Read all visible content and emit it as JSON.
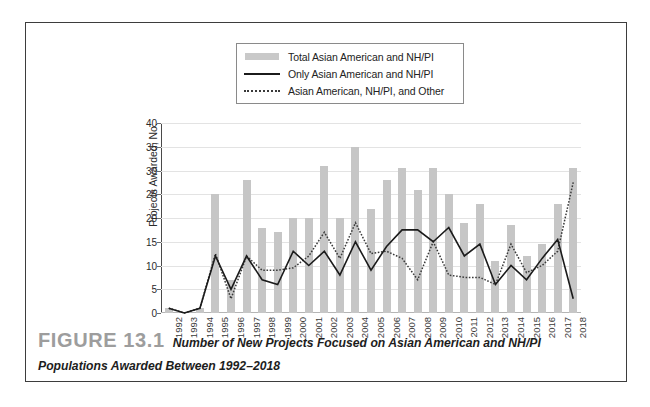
{
  "figure": {
    "number_label": "FIGURE 13.1",
    "caption": "Number of New Projects Focused on Asian American and NH/PI Populations Awarded Between 1992–2018"
  },
  "legend": {
    "items": [
      {
        "key": "bar-swatch",
        "label": "Total Asian American and NH/PI"
      },
      {
        "key": "solid-line-swatch",
        "label": "Only Asian American and NH/PI"
      },
      {
        "key": "dotted-line-swatch",
        "label": "Asian American, NH/PI, and Other"
      }
    ]
  },
  "colors": {
    "bar": "#c6c6c6",
    "solid_line": "#1b1b1b",
    "dotted_line": "#3a3a3a",
    "grid": "#e3e3e3",
    "axis": "#4a4a4a",
    "frame": "#3d3d3d",
    "figure_number": "#9d9d9d"
  },
  "chart_data": {
    "type": "bar",
    "title": "",
    "xlabel": "",
    "ylabel": "Projects Awarded, No.",
    "ylim": [
      0,
      40
    ],
    "yticks": [
      0,
      5,
      10,
      15,
      20,
      25,
      30,
      35,
      40
    ],
    "grid": true,
    "legend_position": "top-center",
    "categories": [
      "1992",
      "1993",
      "1994",
      "1995",
      "1996",
      "1997",
      "1998",
      "1999",
      "2000",
      "2001",
      "2002",
      "2003",
      "2004",
      "2005",
      "2006",
      "2007",
      "2008",
      "2009",
      "2010",
      "2011",
      "2012",
      "2013",
      "2014",
      "2015",
      "2016",
      "2017",
      "2018"
    ],
    "series": [
      {
        "name": "Total Asian American and NH/PI",
        "type": "bar",
        "values": [
          1,
          0,
          1,
          25,
          7,
          28,
          18,
          17,
          20,
          20,
          31,
          20,
          35,
          22,
          28,
          30.5,
          26,
          30.5,
          25,
          19,
          23,
          11,
          18.5,
          12,
          14.5,
          23,
          30.5
        ]
      },
      {
        "name": "Only Asian American and NH/PI",
        "type": "line",
        "values": [
          1,
          0,
          1,
          12,
          5,
          12,
          7,
          6,
          13,
          10,
          13,
          8,
          15,
          9,
          14,
          17.5,
          17.5,
          15,
          18,
          12,
          14.5,
          6,
          10,
          7,
          11.5,
          15.5,
          3
        ]
      },
      {
        "name": "Asian American, NH/PI, and Other",
        "type": "dotted-line",
        "values": [
          1,
          0,
          1,
          12.5,
          3,
          12,
          9,
          9,
          9.5,
          12,
          17,
          11.5,
          19,
          12.5,
          13,
          11.5,
          7,
          15,
          8,
          7.5,
          7.5,
          6,
          14.5,
          8.5,
          10,
          13,
          27.5
        ]
      }
    ]
  }
}
